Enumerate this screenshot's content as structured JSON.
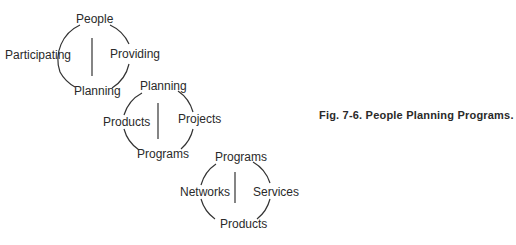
{
  "figure": {
    "caption": "Fig. 7-6. People Planning Programs."
  },
  "cycles": [
    {
      "top": "People",
      "left": "Participating",
      "right": "Providing",
      "bottom": "Planning"
    },
    {
      "top": "Planning",
      "left": "Products",
      "right": "Projects",
      "bottom": "Programs"
    },
    {
      "top": "Programs",
      "left": "Networks",
      "right": "Services",
      "bottom": "Products"
    }
  ],
  "colors": {
    "ink": "#2a2a2a",
    "background": "#ffffff"
  }
}
